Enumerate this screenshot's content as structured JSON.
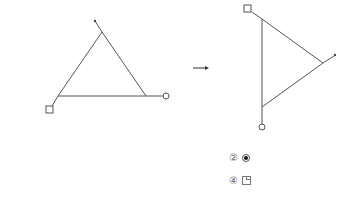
{
  "diagram": {
    "stroke_color": "#555555",
    "left_figure": {
      "vertices": {
        "top": [
          102,
          32
        ],
        "bottom_left": [
          58,
          96
        ],
        "bottom_right": [
          146,
          96
        ]
      },
      "markers": {
        "dot": [
          95,
          21
        ],
        "square": [
          50,
          110
        ],
        "circle": [
          166,
          96
        ]
      }
    },
    "arrow": {
      "from": [
        193,
        68
      ],
      "to": [
        208,
        68
      ]
    },
    "right_figure": {
      "vertices": {
        "top": [
          262,
          19
        ],
        "right": [
          323,
          63
        ],
        "bottom": [
          262,
          107
        ]
      },
      "markers": {
        "square": [
          248,
          9
        ],
        "dot": [
          335,
          55
        ],
        "circle": [
          262,
          127
        ]
      }
    }
  },
  "options": [
    {
      "number": "②",
      "symbol": "filled-circle-in-circle"
    },
    {
      "number": "④",
      "symbol": "square-with-corner"
    }
  ]
}
